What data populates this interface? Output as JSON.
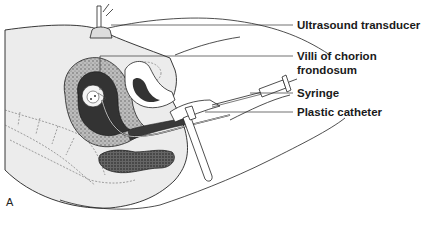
{
  "figure": {
    "panel_letter": "A",
    "labels": {
      "ultrasound_transducer": "Ultrasound transducer",
      "villi_line1": "Villi of chorion",
      "villi_line2": "frondosum",
      "syringe": "Syringe",
      "plastic_catheter": "Plastic catheter"
    },
    "colors": {
      "line": "#222222",
      "body_fill": "#ececec",
      "tissue_dark": "#3a3a3a",
      "background": "#ffffff"
    }
  }
}
